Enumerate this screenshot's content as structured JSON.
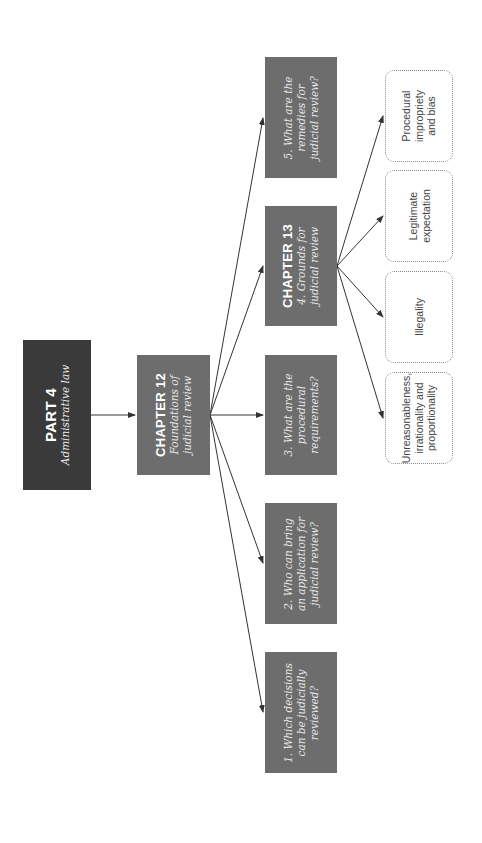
{
  "part": {
    "title": "PART 4",
    "subtitle": "Administrative law"
  },
  "chapter12": {
    "title": "CHAPTER 12",
    "subtitle_line1": "Foundations of",
    "subtitle_line2": "judicial review"
  },
  "questions": [
    {
      "line1": "1. Which decisions",
      "line2": "can be judicially",
      "line3": "reviewed?"
    },
    {
      "line1": "2. Who can bring",
      "line2": "an application for",
      "line3": "judicial review?"
    },
    {
      "line1": "3. What are the",
      "line2": "procedural",
      "line3": "requirements?"
    },
    {
      "line1": "5. What are the",
      "line2": "remedies for",
      "line3": "judicial review?"
    }
  ],
  "chapter13": {
    "title": "CHAPTER 13",
    "subtitle_line1": "4. Grounds for",
    "subtitle_line2": "judicial review"
  },
  "grounds": [
    {
      "line1": "Unreasonableness,",
      "line2": "irrationality and",
      "line3": "proportionality"
    },
    {
      "line1": "Illegality",
      "line2": "",
      "line3": ""
    },
    {
      "line1": "Legitimate",
      "line2": "expectation",
      "line3": ""
    },
    {
      "line1": "Procedural",
      "line2": "impropriety",
      "line3": "and bias"
    }
  ],
  "colors": {
    "part_box": "#3a3a3a",
    "chapter_box": "#6d6d6d",
    "line": "#333333",
    "dotted_border": "#8a8a8a"
  }
}
